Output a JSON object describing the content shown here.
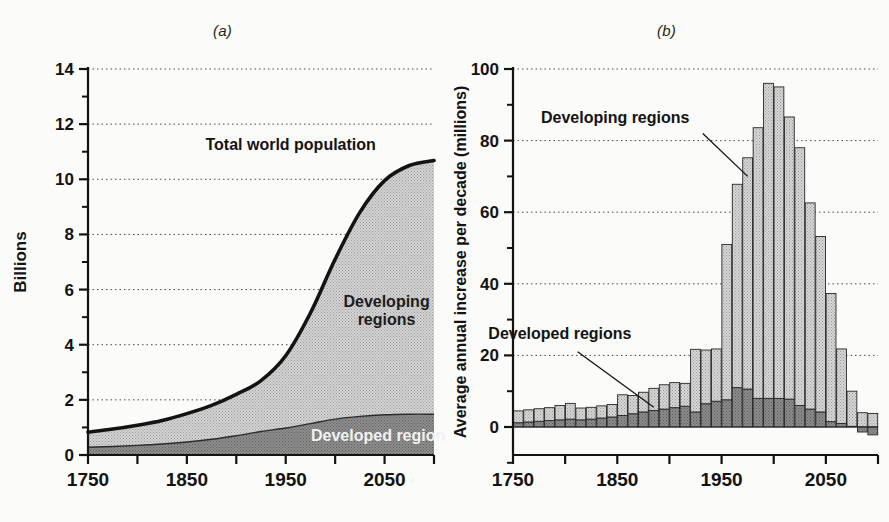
{
  "figure": {
    "panel_a_label": "(a)",
    "panel_b_label": "(b)"
  },
  "panel_a": {
    "ylabel": "Billions",
    "y_ticks": [
      "0",
      "2",
      "4",
      "6",
      "8",
      "10",
      "12",
      "14"
    ],
    "x_ticks": [
      "1750",
      "1850",
      "1950",
      "2050"
    ],
    "annotation_total": "Total world population",
    "annotation_developing_line1": "Developing",
    "annotation_developing_line2": "regions",
    "annotation_developed": "Developed regions"
  },
  "panel_b": {
    "ylabel": "Average annual increase per decade (millions)",
    "y_ticks": [
      "0",
      "20",
      "40",
      "60",
      "80",
      "100"
    ],
    "x_ticks": [
      "1750",
      "1850",
      "1950",
      "2050"
    ],
    "annotation_developing": "Developing regions",
    "annotation_developed": "Developed regions"
  },
  "colors": {
    "ink": "#131313",
    "developing_fill": "#cfcfcf",
    "developed_fill": "#8a8a8a",
    "grid": "#4a4a4a",
    "page": "#fbfbf9"
  },
  "chart_data": [
    {
      "id": "panel-a",
      "type": "area",
      "title": "(a)",
      "xlabel": "",
      "ylabel": "Billions",
      "xlim": [
        1750,
        2100
      ],
      "ylim": [
        0,
        14
      ],
      "x_ticks": [
        1750,
        1800,
        1850,
        1900,
        1950,
        2000,
        2050,
        2100
      ],
      "x_tick_labels": [
        "1750",
        "",
        "1850",
        "",
        "1950",
        "",
        "2050",
        ""
      ],
      "y_ticks": [
        0,
        2,
        4,
        6,
        8,
        10,
        12,
        14
      ],
      "y_minor_ticks": [
        1,
        3,
        5,
        7,
        9,
        11,
        13
      ],
      "grid": "horizontal-dotted",
      "legend": "inline-annotations",
      "stacked": true,
      "x": [
        1750,
        1775,
        1800,
        1825,
        1850,
        1875,
        1900,
        1925,
        1950,
        1975,
        2000,
        2025,
        2050,
        2075,
        2100
      ],
      "series": [
        {
          "name": "Developed regions",
          "values": [
            0.28,
            0.31,
            0.35,
            0.4,
            0.47,
            0.57,
            0.7,
            0.85,
            0.98,
            1.14,
            1.3,
            1.4,
            1.46,
            1.48,
            1.48
          ]
        },
        {
          "name": "Developing regions",
          "values": [
            0.55,
            0.63,
            0.73,
            0.85,
            1.03,
            1.23,
            1.5,
            1.85,
            2.6,
            4.0,
            5.8,
            7.4,
            8.5,
            9.0,
            9.2
          ]
        }
      ],
      "total_line": {
        "name": "Total world population",
        "values": [
          0.83,
          0.94,
          1.08,
          1.25,
          1.5,
          1.8,
          2.2,
          2.7,
          3.6,
          5.15,
          7.1,
          8.8,
          9.95,
          10.5,
          10.68
        ]
      },
      "annotations": [
        {
          "text": "Total world population",
          "x": 1955,
          "y": 11.1
        },
        {
          "text": "Developing regions",
          "x": 2045,
          "y": 5.1
        },
        {
          "text": "Developed regions",
          "x": 2040,
          "y": 0.75
        }
      ]
    },
    {
      "id": "panel-b",
      "type": "bar",
      "title": "(b)",
      "xlabel": "",
      "ylabel": "Average annual increase per decade (millions)",
      "xlim": [
        1750,
        2100
      ],
      "ylim": [
        -6,
        100
      ],
      "x_ticks": [
        1750,
        1800,
        1850,
        1900,
        1950,
        2000,
        2050,
        2100
      ],
      "x_tick_labels": [
        "1750",
        "",
        "1850",
        "",
        "1950",
        "",
        "2050",
        ""
      ],
      "y_ticks": [
        0,
        20,
        40,
        60,
        80,
        100
      ],
      "y_minor_ticks": [
        10,
        30,
        50,
        70,
        90
      ],
      "grid": "horizontal-dotted",
      "stacked": true,
      "bar_width_years": 10,
      "categories": [
        1750,
        1760,
        1770,
        1780,
        1790,
        1800,
        1810,
        1820,
        1830,
        1840,
        1850,
        1860,
        1870,
        1880,
        1890,
        1900,
        1910,
        1920,
        1930,
        1940,
        1950,
        1960,
        1970,
        1980,
        1990,
        2000,
        2010,
        2020,
        2030,
        2040,
        2050,
        2060,
        2070,
        2080,
        2090
      ],
      "series": [
        {
          "name": "Developed regions",
          "values": [
            1.2,
            1.4,
            1.6,
            1.8,
            2.0,
            2.2,
            2.0,
            2.2,
            2.5,
            2.8,
            3.2,
            3.7,
            4.2,
            4.6,
            5.0,
            5.4,
            5.8,
            4.2,
            6.5,
            7.2,
            7.6,
            11.0,
            10.6,
            8.0,
            8.0,
            8.0,
            7.8,
            6.0,
            5.0,
            4.2,
            1.5,
            1.0,
            0.2,
            -1.4,
            -2.2
          ]
        },
        {
          "name": "Developing regions",
          "values": [
            3.3,
            3.4,
            3.5,
            3.6,
            4.0,
            4.4,
            3.3,
            3.3,
            3.4,
            3.5,
            5.8,
            5.1,
            5.5,
            6.2,
            6.8,
            7.0,
            6.4,
            17.5,
            15.0,
            14.6,
            43.4,
            56.8,
            64.6,
            75.6,
            88.0,
            87.0,
            78.8,
            72.0,
            57.6,
            49.0,
            35.8,
            20.8,
            9.8,
            4.0,
            3.8
          ]
        }
      ],
      "totals": [
        4.5,
        4.8,
        5.1,
        5.4,
        6.0,
        6.6,
        5.3,
        5.5,
        5.9,
        6.3,
        9.0,
        8.8,
        9.7,
        10.8,
        11.8,
        12.4,
        12.2,
        21.7,
        21.5,
        21.8,
        51.0,
        67.8,
        75.2,
        83.6,
        96.0,
        95.0,
        86.6,
        78.0,
        62.6,
        53.2,
        37.3,
        21.8,
        10.0,
        2.6,
        1.6
      ],
      "annotations": [
        {
          "text": "Developing regions",
          "x": 1845,
          "y": 87,
          "leader_to": {
            "x": 1972,
            "y": 72
          }
        },
        {
          "text": "Developed regions",
          "x": 1790,
          "y": 25,
          "leader_to": {
            "x": 1888,
            "y": 6.5
          }
        }
      ]
    }
  ]
}
